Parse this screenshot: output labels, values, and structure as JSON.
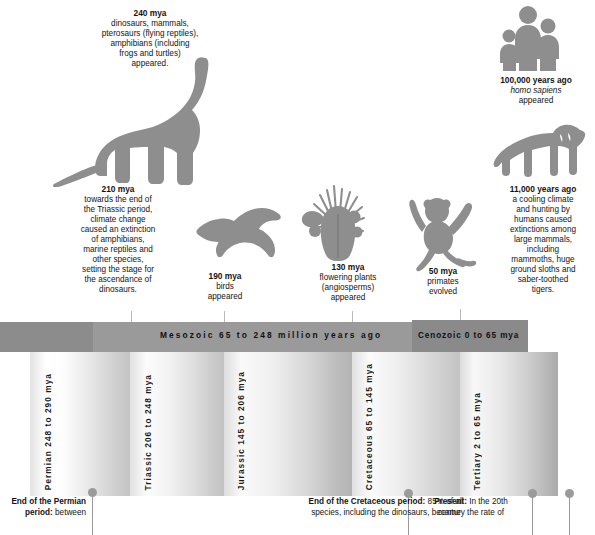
{
  "events": [
    {
      "id": "e240",
      "headline": "240 mya",
      "body": "dinosaurs, mammals,\npterosaurs (flying reptiles),\namphibians (including\nfrogs and turtles)\nappeared.",
      "icon": "sauropod-dinosaur-icon"
    },
    {
      "id": "e210",
      "headline": "210 mya",
      "body": "towards the end of\nthe Triassic period,\nclimate change\ncaused an extinction\nof amphibians,\nmarine reptiles and\nother species,\nsetting the stage for\nthe ascendance of\ndinosaurs.",
      "icon": "none"
    },
    {
      "id": "e190",
      "headline": "190 mya",
      "body": "birds\nappeared",
      "icon": "bird-icon"
    },
    {
      "id": "e130",
      "headline": "130 mya",
      "body": "flowering plants\n(angiosperms)\nappeared",
      "icon": "flowering-plant-icon"
    },
    {
      "id": "e50",
      "headline": "50 mya",
      "body": "primates\nevolved",
      "icon": "primate-icon"
    },
    {
      "id": "e100k",
      "headline": "100,000 years ago",
      "body_italic": "homo sapiens",
      "body": "appeared",
      "icon": "human-family-icon"
    },
    {
      "id": "e11k",
      "headline": "11,000 years ago",
      "body": "a cooling climate\nand hunting by\nhumans caused\nextinctions among\nlarge mammals,\nincluding\nmammoths, huge\nground sloths and\nsaber-toothed\ntigers.",
      "icon": "saber-toothed-tiger-icon"
    }
  ],
  "eras": [
    {
      "id": "mesozoic",
      "label": "Mesozoic 65 to 248 million years ago"
    },
    {
      "id": "cenozoic",
      "label": "Cenozoic 0 to 65 mya"
    }
  ],
  "periods": [
    {
      "id": "permian",
      "label": "Permian 248 to 290 mya"
    },
    {
      "id": "triassic",
      "label": "Triassic 206 to 248 mya"
    },
    {
      "id": "jurassic",
      "label": "Jurassic 145 to 206 mya"
    },
    {
      "id": "cretaceous",
      "label": "Cretaceous 65 to 145 mya"
    },
    {
      "id": "tertiary",
      "label": "Tertiary 2 to 65 mya"
    }
  ],
  "footnotes": [
    {
      "id": "permian-extinction",
      "lead": "End of the Permian period:",
      "rest": " between"
    },
    {
      "id": "cretaceous-extinction",
      "lead": "End of the Cretaceous period:",
      "rest": " 85% of all",
      "line2": "species, including the dinosaurs, became"
    },
    {
      "id": "present",
      "lead": "Present:",
      "rest": " In the 20th",
      "line2": "century the rate of"
    }
  ],
  "colors": {
    "silhouette": "#8e8e8e",
    "era_bar": "#8c8c8c",
    "era_bar_dark": "#8a8a8a",
    "pin": "#9b9b9b",
    "text": "#141414"
  }
}
